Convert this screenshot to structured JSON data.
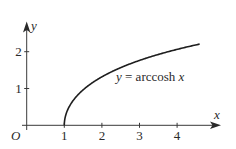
{
  "chart_data": {
    "type": "line",
    "title": "",
    "function_label": {
      "prefix_var": "y",
      "equals": " = arccosh ",
      "suffix_var": "x"
    },
    "xlabel": "x",
    "ylabel": "y",
    "origin_label": "O",
    "x_ticks": [
      {
        "value": 1,
        "label": "1"
      },
      {
        "value": 2,
        "label": "2"
      },
      {
        "value": 3,
        "label": "3"
      },
      {
        "value": 4,
        "label": "4"
      }
    ],
    "y_ticks": [
      {
        "value": 1,
        "label": "1"
      },
      {
        "value": 2,
        "label": "2"
      }
    ],
    "xlim": [
      0,
      5.1
    ],
    "ylim": [
      0,
      2.8
    ],
    "grid": false,
    "series": [
      {
        "name": "y = arccosh x",
        "x": [
          1,
          1.01,
          1.05,
          1.1,
          1.2,
          1.35,
          1.5,
          1.75,
          2,
          2.5,
          3,
          3.5,
          4,
          4.3,
          4.6
        ],
        "y": [
          0,
          0.141,
          0.315,
          0.443,
          0.622,
          0.807,
          0.962,
          1.159,
          1.317,
          1.567,
          1.763,
          1.925,
          2.063,
          2.137,
          2.207
        ]
      }
    ],
    "colors": {
      "curve": "#1e1e1e",
      "axes": "#3a3a3a",
      "text": "#2a2a2a"
    }
  },
  "layout": {
    "origin_px": [
      26.7,
      125.3
    ],
    "x_unit_px": 37.6,
    "y_unit_px": 36.8
  }
}
